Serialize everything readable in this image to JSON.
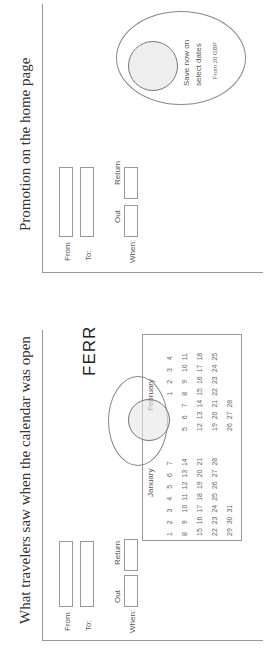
{
  "panels": [
    {
      "title": "What travelers saw when the calendar was open",
      "form": {
        "from_label": "From",
        "to_label": "To:",
        "when_label": "When:",
        "out_label": "Out",
        "return_label": "Return"
      },
      "brand": "FERR",
      "calendar": {
        "months": [
          {
            "name": "January",
            "rows": [
              "1  2  3  4  5  6  7",
              "8  9  10 11 12 13 14",
              "15 16 17 18 19 20 21",
              "22 23 24 25 26 27 28",
              "29 30 31"
            ]
          },
          {
            "name": "February",
            "rows": [
              "         1  2  3  4",
              "5  6  7  8  9  10 11",
              "12 13 14 15 16 17 18",
              "19 20 21 22 23 24 25",
              "26 27 28"
            ]
          }
        ]
      }
    },
    {
      "title": "Promotion on the home page",
      "form": {
        "from_label": "From",
        "to_label": "To:",
        "when_label": "When:",
        "out_label": "Out",
        "return_label": "Return"
      },
      "promo": {
        "line1": "Save now on",
        "line2": "select dates",
        "price": "From 20 GBP"
      }
    }
  ]
}
